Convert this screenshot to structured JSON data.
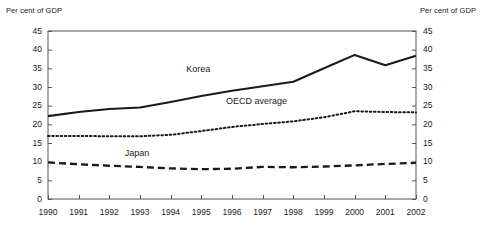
{
  "chart_data": {
    "type": "line",
    "title": "",
    "subtitle": "",
    "xlabel": "",
    "ylabel": "Per cent of GDP",
    "ylabel_right": "Per cent of GDP",
    "x": [
      1990,
      1991,
      1992,
      1993,
      1994,
      1995,
      1996,
      1997,
      1998,
      1999,
      2000,
      2001,
      2002
    ],
    "categories": [
      "1990",
      "1991",
      "1992",
      "1993",
      "1994",
      "1995",
      "1996",
      "1997",
      "1998",
      "1999",
      "2000",
      "2001",
      "2002"
    ],
    "ylim": [
      0,
      45
    ],
    "yticks": [
      0,
      5,
      10,
      15,
      20,
      25,
      30,
      35,
      40,
      45
    ],
    "yticks_right": [
      0,
      5,
      10,
      15,
      20,
      25,
      30,
      35,
      40,
      45
    ],
    "grid": false,
    "legend": "inline-annotations",
    "series": [
      {
        "name": "Korea",
        "style": "solid",
        "color": "#1a1a1a",
        "values": [
          22.2,
          23.3,
          24.1,
          24.5,
          26.0,
          27.6,
          29.0,
          30.2,
          31.4,
          35.0,
          38.6,
          35.8,
          38.4
        ],
        "label_x": 1994.9,
        "label_y": 34.6
      },
      {
        "name": "OECD average",
        "style": "dotted",
        "color": "#1a1a1a",
        "values": [
          16.9,
          16.9,
          16.8,
          16.8,
          17.2,
          18.2,
          19.3,
          20.1,
          20.8,
          21.9,
          23.5,
          23.3,
          23.2
        ],
        "label_x": 1996.8,
        "label_y": 26.0
      },
      {
        "name": "Japan",
        "style": "dashed",
        "color": "#1a1a1a",
        "values": [
          9.8,
          9.3,
          8.9,
          8.6,
          8.2,
          8.0,
          8.1,
          8.6,
          8.5,
          8.7,
          9.0,
          9.4,
          9.7
        ],
        "label_x": 1992.9,
        "label_y": 12.0
      }
    ],
    "annotations": [
      {
        "text": "Per cent of GDP",
        "position": "top-left"
      },
      {
        "text": "Per cent of GDP",
        "position": "top-right"
      }
    ]
  }
}
